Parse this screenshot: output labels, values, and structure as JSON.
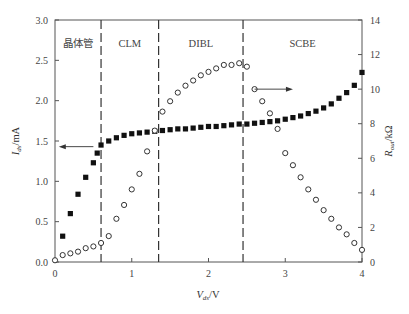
{
  "chart_data": {
    "type": "scatter",
    "title": "",
    "xlabel": "V_ds/V",
    "ylabel_left": "I_ds/mA",
    "ylabel_right": "R_out/kΩ",
    "xlim": [
      0,
      4
    ],
    "ylim_left": [
      0,
      3.0
    ],
    "ylim_right": [
      0,
      14
    ],
    "x_ticks": [
      "0",
      "1",
      "2",
      "3",
      "4"
    ],
    "y_ticks_left": [
      "0.0",
      "0.5",
      "1.0",
      "1.5",
      "2.0",
      "2.5",
      "3.0"
    ],
    "y_ticks_right": [
      "0",
      "2",
      "4",
      "6",
      "8",
      "10",
      "12",
      "14"
    ],
    "grid": false,
    "regions": [
      {
        "label": "晶体管",
        "x_start": 0.0,
        "x_end": 0.6
      },
      {
        "label": "CLM",
        "x_start": 0.6,
        "x_end": 1.35
      },
      {
        "label": "DIBL",
        "x_start": 1.35,
        "x_end": 2.45
      },
      {
        "label": "SCBE",
        "x_start": 2.45,
        "x_end": 4.0
      }
    ],
    "region_boundaries": [
      0.6,
      1.35,
      2.45
    ],
    "series": [
      {
        "name": "I_ds",
        "axis": "left",
        "marker": "filled-square",
        "x": [
          0.1,
          0.2,
          0.3,
          0.4,
          0.5,
          0.55,
          0.6,
          0.7,
          0.8,
          0.9,
          1.0,
          1.1,
          1.2,
          1.3,
          1.4,
          1.5,
          1.6,
          1.7,
          1.8,
          1.9,
          2.0,
          2.1,
          2.2,
          2.3,
          2.4,
          2.5,
          2.6,
          2.7,
          2.8,
          2.9,
          3.0,
          3.1,
          3.2,
          3.3,
          3.4,
          3.5,
          3.6,
          3.7,
          3.8,
          3.9,
          4.0
        ],
        "values": [
          0.32,
          0.6,
          0.84,
          1.05,
          1.23,
          1.35,
          1.45,
          1.5,
          1.54,
          1.57,
          1.59,
          1.6,
          1.61,
          1.62,
          1.63,
          1.64,
          1.65,
          1.65,
          1.66,
          1.67,
          1.68,
          1.68,
          1.69,
          1.7,
          1.71,
          1.71,
          1.72,
          1.73,
          1.74,
          1.75,
          1.77,
          1.79,
          1.81,
          1.84,
          1.87,
          1.91,
          1.96,
          2.03,
          2.1,
          2.19,
          2.35
        ]
      },
      {
        "name": "R_out",
        "axis": "right",
        "marker": "open-circle",
        "x": [
          0.0,
          0.1,
          0.2,
          0.3,
          0.4,
          0.5,
          0.6,
          0.7,
          0.8,
          0.9,
          1.0,
          1.1,
          1.2,
          1.3,
          1.4,
          1.5,
          1.6,
          1.7,
          1.8,
          1.9,
          2.0,
          2.1,
          2.2,
          2.3,
          2.4,
          2.5,
          2.6,
          2.7,
          2.8,
          2.9,
          3.0,
          3.1,
          3.2,
          3.3,
          3.4,
          3.5,
          3.6,
          3.7,
          3.8,
          3.9,
          4.0
        ],
        "values": [
          0.1,
          0.4,
          0.5,
          0.6,
          0.8,
          0.9,
          1.1,
          1.5,
          2.5,
          3.3,
          4.2,
          5.1,
          6.4,
          7.6,
          8.7,
          9.3,
          9.8,
          10.2,
          10.5,
          10.8,
          11.0,
          11.2,
          11.4,
          11.4,
          11.5,
          11.3,
          10.0,
          9.3,
          8.6,
          7.7,
          6.3,
          5.6,
          4.9,
          4.2,
          3.6,
          3.0,
          2.5,
          2.0,
          1.6,
          1.1,
          0.7
        ]
      }
    ],
    "annotations": [
      {
        "type": "arrow",
        "direction": "left",
        "near_series": "I_ds",
        "y_value": 1.43,
        "x_from": 0.5,
        "x_to": 0.05
      },
      {
        "type": "arrow",
        "direction": "right",
        "near_series": "R_out",
        "x_from": 2.6,
        "x_to": 3.1,
        "y_right_value": 10.0
      }
    ]
  }
}
